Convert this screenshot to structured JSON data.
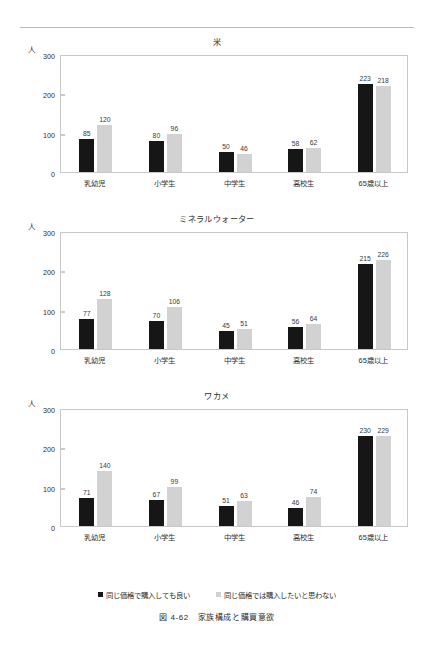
{
  "page": {
    "caption": "図 4-62　家族構成と購買意欲",
    "unit_label": "人"
  },
  "legend": {
    "items": [
      {
        "label": "同じ価格で購入しても良い",
        "color": "#161616",
        "marker": "square-dark"
      },
      {
        "label": "同じ価格では購入したいと思わない",
        "color": "#d2d2d2",
        "marker": "square-light"
      }
    ]
  },
  "axis": {
    "yticks": [
      "300",
      "200",
      "100",
      "0"
    ],
    "ymax": 300,
    "categories": [
      "乳幼児",
      "小学生",
      "中学生",
      "高校生",
      "65歳以上"
    ]
  },
  "chart_data": [
    {
      "type": "bar",
      "title": "米",
      "xlabel": "",
      "ylabel": "人",
      "ylim": [
        0,
        300
      ],
      "grid": false,
      "legend_position": "bottom",
      "categories": [
        "乳幼児",
        "小学生",
        "中学生",
        "高校生",
        "65歳以上"
      ],
      "series": [
        {
          "name": "同じ価格で購入しても良い",
          "color": "#161616",
          "values": [
            85,
            80,
            50,
            58,
            223
          ]
        },
        {
          "name": "同じ価格では購入したいと思わない",
          "color": "#d2d2d2",
          "values": [
            120,
            96,
            46,
            62,
            218
          ]
        }
      ]
    },
    {
      "type": "bar",
      "title": "ミネラルウォーター",
      "xlabel": "",
      "ylabel": "人",
      "ylim": [
        0,
        300
      ],
      "grid": false,
      "legend_position": "bottom",
      "categories": [
        "乳幼児",
        "小学生",
        "中学生",
        "高校生",
        "65歳以上"
      ],
      "series": [
        {
          "name": "同じ価格で購入しても良い",
          "color": "#161616",
          "values": [
            77,
            70,
            45,
            56,
            215
          ]
        },
        {
          "name": "同じ価格では購入したいと思わない",
          "color": "#d2d2d2",
          "values": [
            128,
            106,
            51,
            64,
            226
          ]
        }
      ]
    },
    {
      "type": "bar",
      "title": "ワカメ",
      "xlabel": "",
      "ylabel": "人",
      "ylim": [
        0,
        300
      ],
      "grid": false,
      "legend_position": "bottom",
      "categories": [
        "乳幼児",
        "小学生",
        "中学生",
        "高校生",
        "65歳以上"
      ],
      "series": [
        {
          "name": "同じ価格で購入しても良い",
          "color": "#161616",
          "values": [
            71,
            67,
            51,
            46,
            230
          ]
        },
        {
          "name": "同じ価格では購入したいと思わない",
          "color": "#d2d2d2",
          "values": [
            140,
            99,
            63,
            74,
            229
          ]
        }
      ]
    }
  ]
}
